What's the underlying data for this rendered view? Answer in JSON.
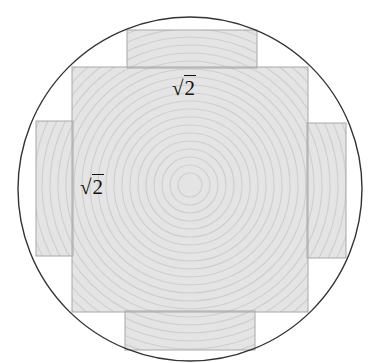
{
  "diagram": {
    "type": "geometry",
    "labels": {
      "top_side": {
        "radical": "√",
        "value": "2"
      },
      "left_side": {
        "radical": "√",
        "value": "2"
      }
    },
    "colors": {
      "fill": "#e4e4e4",
      "ring": "#cfcfcf",
      "edge": "#a8a8a8",
      "circle": "#333333"
    }
  }
}
